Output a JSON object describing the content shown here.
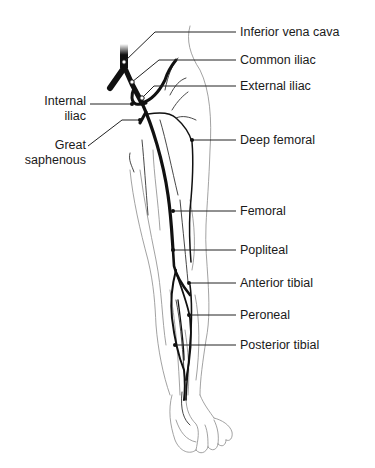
{
  "diagram": {
    "labels": {
      "inferior_vena_cava": "Inferior vena cava",
      "common_iliac": "Common iliac",
      "external_iliac": "External iliac",
      "internal_iliac_line1": "Internal",
      "internal_iliac_line2": "iliac",
      "great_saphenous_line1": "Great",
      "great_saphenous_line2": "saphenous",
      "deep_femoral": "Deep femoral",
      "femoral": "Femoral",
      "popliteal": "Popliteal",
      "anterior_tibial": "Anterior tibial",
      "peroneal": "Peroneal",
      "posterior_tibial": "Posterior tibial"
    },
    "colors": {
      "vein": "#111111",
      "outline": "#8a8a8a",
      "text": "#1a1a1a",
      "background": "#ffffff"
    }
  }
}
